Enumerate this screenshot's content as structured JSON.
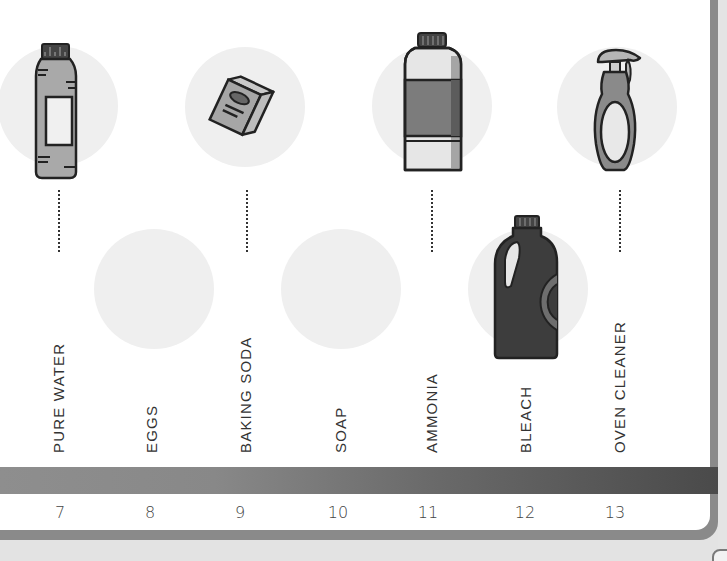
{
  "scale": {
    "title": "pH scale (alkaline side)",
    "bar_gradient": [
      "#8e8e8e",
      "#4a4a4a"
    ],
    "items": [
      {
        "ph": "7",
        "label": "PURE WATER",
        "icon": "water-bottle-icon",
        "position": "top"
      },
      {
        "ph": "8",
        "label": "EGGS",
        "icon": "eggs-icon",
        "position": "bottom"
      },
      {
        "ph": "9",
        "label": "BAKING SODA",
        "icon": "baking-soda-box-icon",
        "position": "top"
      },
      {
        "ph": "10",
        "label": "SOAP",
        "icon": "soap-icon",
        "position": "bottom"
      },
      {
        "ph": "11",
        "label": "AMMONIA",
        "icon": "ammonia-bottle-icon",
        "position": "top"
      },
      {
        "ph": "12",
        "label": "BLEACH",
        "icon": "bleach-jug-icon",
        "position": "bottom"
      },
      {
        "ph": "13",
        "label": "OVEN CLEANER",
        "icon": "spray-bottle-icon",
        "position": "top"
      }
    ]
  }
}
